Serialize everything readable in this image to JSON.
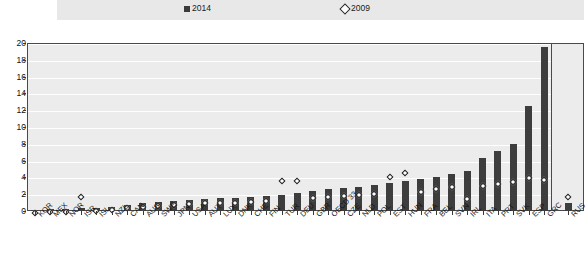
{
  "legend": {
    "items": [
      {
        "label": "2014",
        "marker": "filled-square-icon",
        "color": "#3d3d3d"
      },
      {
        "label": "2009",
        "marker": "open-diamond-icon",
        "color": "#ffffff"
      }
    ]
  },
  "axis": {
    "y_ticks": [
      "20",
      "18",
      "16",
      "14",
      "12",
      "10",
      "8",
      "6",
      "4",
      "2",
      "0"
    ]
  },
  "chart_data": {
    "type": "bar",
    "title": "",
    "xlabel": "",
    "ylabel": "",
    "ylim": [
      0,
      20
    ],
    "ytick_step": 2,
    "grid": true,
    "legend_position": "top",
    "categories": [
      "KOR",
      "MEX",
      "NOR",
      "ISR",
      "ISL",
      "NZL",
      "CAN",
      "AUS",
      "SWE",
      "JPN",
      "USA",
      "AUT",
      "LUX",
      "DNK",
      "CHE",
      "FIN",
      "TUR",
      "DEU",
      "GBR",
      "OECD 33",
      "CZE",
      "NLD",
      "POL",
      "EST",
      "HUN",
      "FRA",
      "BEL",
      "SVN",
      "IRL",
      "ITA",
      "PRT",
      "SVK",
      "ESP",
      "GRC",
      "RUS"
    ],
    "series": [
      {
        "name": "2014",
        "marker": "bar",
        "values": [
          0.1,
          0.2,
          0.2,
          0.3,
          0.4,
          0.5,
          0.7,
          0.9,
          1.1,
          1.2,
          1.3,
          1.4,
          1.5,
          1.6,
          1.7,
          1.8,
          1.9,
          2.2,
          2.4,
          2.6,
          2.7,
          2.9,
          3.1,
          3.3,
          3.6,
          3.8,
          4.1,
          4.4,
          4.8,
          6.3,
          7.2,
          8.0,
          12.5,
          19.5,
          1.0
        ]
      },
      {
        "name": "2009",
        "marker": "diamond",
        "values": [
          0.1,
          0.2,
          0.2,
          2.0,
          0.3,
          0.4,
          0.6,
          0.8,
          0.9,
          1.0,
          1.1,
          1.2,
          1.2,
          1.3,
          1.4,
          1.5,
          3.9,
          3.9,
          1.9,
          2.0,
          2.1,
          2.2,
          2.3,
          4.4,
          4.8,
          2.6,
          2.9,
          3.1,
          1.7,
          3.3,
          3.5,
          3.8,
          4.2,
          4.0,
          2.0
        ]
      }
    ]
  }
}
